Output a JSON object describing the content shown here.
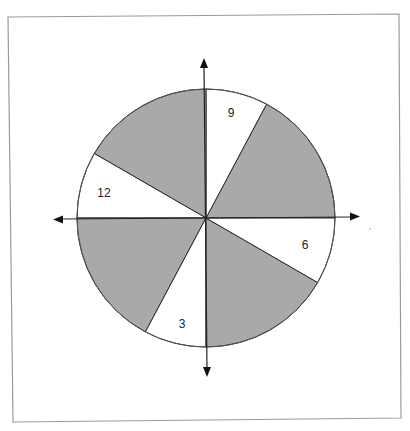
{
  "diagram": {
    "title": "",
    "type": "spinner",
    "center": {
      "x": 206,
      "y": 218
    },
    "radius": 129,
    "colors": {
      "shaded": "#a9a9a9",
      "unshaded": "#ffffff",
      "outline": "#2a2a2a",
      "frame": "#9a9a9a"
    },
    "sectors": [
      {
        "start_deg": 0,
        "end_deg": 62,
        "shaded": true,
        "label": ""
      },
      {
        "start_deg": 62,
        "end_deg": 90,
        "shaded": false,
        "label": "9"
      },
      {
        "start_deg": 90,
        "end_deg": 150,
        "shaded": true,
        "label": ""
      },
      {
        "start_deg": 150,
        "end_deg": 180,
        "shaded": false,
        "label": "12"
      },
      {
        "start_deg": 180,
        "end_deg": 242,
        "shaded": true,
        "label": ""
      },
      {
        "start_deg": 242,
        "end_deg": 270,
        "shaded": false,
        "label": "3"
      },
      {
        "start_deg": 270,
        "end_deg": 330,
        "shaded": true,
        "label": ""
      },
      {
        "start_deg": 330,
        "end_deg": 360,
        "shaded": false,
        "label": "6"
      }
    ],
    "labels": {
      "nine": "9",
      "twelve": "12",
      "three": "3",
      "six": "6"
    },
    "axes": {
      "horizontal": {
        "from": 54,
        "to": 359,
        "arrows": "both"
      },
      "vertical": {
        "from": 59,
        "to": 376,
        "arrows": "both"
      }
    }
  }
}
